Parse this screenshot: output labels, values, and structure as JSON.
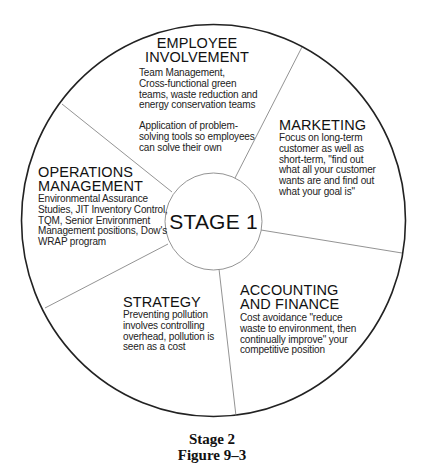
{
  "diagram": {
    "center": {
      "label": "STAGE 1"
    },
    "segments": [
      {
        "id": "employee-involvement",
        "heading": [
          "EMPLOYEE",
          "INVOLVEMENT"
        ],
        "body": [
          "Team Management,",
          "Cross-functional green",
          "teams, waste reduction and",
          "energy conservation teams"
        ],
        "body2": [
          "Application of problem-",
          "solving tools so employees",
          "can solve their own"
        ]
      },
      {
        "id": "marketing",
        "heading": [
          "MARKETING"
        ],
        "body": [
          "Focus on long-term",
          "customer as well as",
          "short-term, \"find out",
          "what all your customer",
          "wants are and find out",
          "what your goal is\""
        ]
      },
      {
        "id": "accounting-and-finance",
        "heading": [
          "ACCOUNTING",
          "AND FINANCE"
        ],
        "body": [
          "Cost avoidance \"reduce",
          "waste to environment, then",
          "continually improve\" your",
          "competitive position"
        ]
      },
      {
        "id": "strategy",
        "heading": [
          "STRATEGY"
        ],
        "body": [
          "Preventing pollution",
          "involves controlling",
          "overhead, pollution is",
          "seen as a cost"
        ]
      },
      {
        "id": "operations-management",
        "heading": [
          "OPERATIONS",
          "MANAGEMENT"
        ],
        "body": [
          "Environmental Assurance",
          "Studies, JIT Inventory Control,",
          "TQM, Senior Environment",
          "Management positions, Dow's",
          "WRAP program"
        ]
      }
    ]
  },
  "caption": {
    "line1": "Stage 2",
    "line2": "Figure 9–3"
  },
  "colors": {
    "outer_ring": "#222222",
    "spokes": "#777777",
    "inner_ring": "#888888",
    "text": "#111111"
  }
}
